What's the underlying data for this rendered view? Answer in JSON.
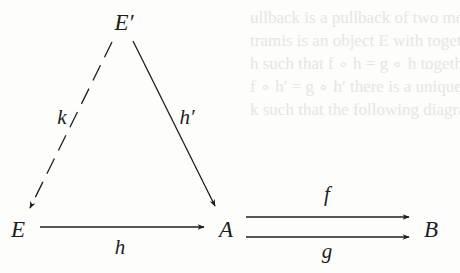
{
  "diagram": {
    "type": "commutative-diagram",
    "objects": [
      {
        "id": "Eprime",
        "label": "E′",
        "x": 124,
        "y": 22
      },
      {
        "id": "E",
        "label": "E",
        "x": 18,
        "y": 229
      },
      {
        "id": "A",
        "label": "A",
        "x": 226,
        "y": 229
      },
      {
        "id": "B",
        "label": "B",
        "x": 431,
        "y": 229
      }
    ],
    "morphisms": [
      {
        "id": "k",
        "label": "k",
        "from": "E′",
        "to": "E",
        "style": "dashed",
        "label_x": 62,
        "label_y": 117
      },
      {
        "id": "hprime",
        "label": "h′",
        "from": "E′",
        "to": "A",
        "style": "solid",
        "label_x": 187,
        "label_y": 117
      },
      {
        "id": "h",
        "label": "h",
        "from": "E",
        "to": "A",
        "style": "solid",
        "label_x": 120,
        "label_y": 247
      },
      {
        "id": "f",
        "label": "f",
        "from": "A",
        "to": "B",
        "style": "solid",
        "label_x": 327,
        "label_y": 194
      },
      {
        "id": "g",
        "label": "g",
        "from": "A",
        "to": "B",
        "style": "solid",
        "label_x": 327,
        "label_y": 251
      }
    ]
  },
  "background_bleed_text": [
    "ullback is a pullback of two morphisms f",
    "tramis is an object E with together with",
    "h such that f ∘ h = g ∘ h together w",
    "f ∘ h′ = g ∘ h′ there is a unique",
    "k such that the following diagram commut"
  ],
  "colors": {
    "ink": "#1e1e1e",
    "paper": "#fdfdfb",
    "bleed": "#e6e6e2"
  }
}
